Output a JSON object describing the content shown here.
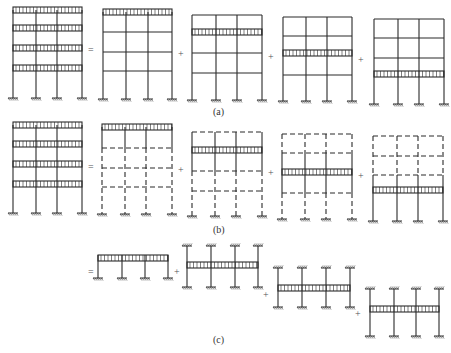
{
  "figure": {
    "colors": {
      "line": "#2a2a2a",
      "dashed": "#3a3a3a",
      "background": "#ffffff"
    },
    "labels": [
      {
        "text": "(a)",
        "x": 213,
        "y": 106
      },
      {
        "text": "(b)",
        "x": 213,
        "y": 224
      },
      {
        "text": "(c)",
        "x": 213,
        "y": 334
      }
    ],
    "operators": [
      {
        "text": "=",
        "x": 88,
        "y": 44
      },
      {
        "text": "+",
        "x": 178,
        "y": 48
      },
      {
        "text": "+",
        "x": 268,
        "y": 51
      },
      {
        "text": "+",
        "x": 358,
        "y": 54
      },
      {
        "text": "=",
        "x": 88,
        "y": 161
      },
      {
        "text": "+",
        "x": 178,
        "y": 164
      },
      {
        "text": "+",
        "x": 268,
        "y": 167
      },
      {
        "text": "+",
        "x": 358,
        "y": 170
      },
      {
        "text": "=",
        "x": 88,
        "y": 266
      },
      {
        "text": "+",
        "x": 174,
        "y": 266
      },
      {
        "text": "+",
        "x": 263,
        "y": 289
      },
      {
        "text": "+",
        "x": 355,
        "y": 308
      }
    ],
    "row_a": [
      {
        "name": "full-frame-all-loaded",
        "cols": [
          13,
          36,
          57,
          82
        ],
        "floors": [
          10,
          28,
          48,
          68
        ],
        "base": 98,
        "loaded": [
          0,
          1,
          2,
          3
        ],
        "dashed_floors": [],
        "solid_col_range": null
      },
      {
        "name": "top-floor-loaded",
        "cols": [
          103,
          126,
          148,
          172
        ],
        "floors": [
          12,
          32,
          52,
          71
        ],
        "base": 99,
        "loaded": [
          0
        ],
        "dashed_floors": [],
        "solid_col_range": null
      },
      {
        "name": "third-floor-loaded",
        "cols": [
          192,
          216,
          237,
          262
        ],
        "floors": [
          15,
          32,
          53,
          73
        ],
        "base": 100,
        "loaded": [
          1
        ],
        "dashed_floors": [],
        "solid_col_range": null
      },
      {
        "name": "second-floor-loaded",
        "cols": [
          283,
          306,
          327,
          352
        ],
        "floors": [
          17,
          36,
          53,
          75
        ],
        "base": 101,
        "loaded": [
          2
        ],
        "dashed_floors": [],
        "solid_col_range": null
      },
      {
        "name": "first-floor-loaded",
        "cols": [
          374,
          398,
          419,
          444
        ],
        "floors": [
          19,
          38,
          58,
          74
        ],
        "base": 104,
        "loaded": [
          3
        ],
        "dashed_floors": [],
        "solid_col_range": null
      }
    ],
    "row_b": [
      {
        "name": "full-frame-all-loaded",
        "cols": [
          13,
          36,
          57,
          82
        ],
        "floors": [
          125,
          144,
          164,
          184
        ],
        "base": 213,
        "loaded": [
          0,
          1,
          2,
          3
        ],
        "dashed_floors": [],
        "solid_col_range": null
      },
      {
        "name": "top-layer-open-frame",
        "cols": [
          102,
          125,
          146,
          172
        ],
        "floors": [
          127,
          148,
          168,
          187
        ],
        "base": 214,
        "loaded": [
          0
        ],
        "dashed_floors": [
          1,
          2,
          3
        ],
        "solid_col_range": [
          127,
          148
        ]
      },
      {
        "name": "third-layer-open-frame",
        "cols": [
          192,
          215,
          236,
          262
        ],
        "floors": [
          132,
          150,
          171,
          191
        ],
        "base": 216,
        "loaded": [
          1
        ],
        "dashed_floors": [
          0,
          2,
          3
        ],
        "solid_col_range": [
          132,
          171
        ]
      },
      {
        "name": "second-layer-open-frame",
        "cols": [
          282,
          305,
          326,
          352
        ],
        "floors": [
          134,
          153,
          172,
          193
        ],
        "base": 219,
        "loaded": [
          2
        ],
        "dashed_floors": [
          0,
          1,
          3
        ],
        "solid_col_range": [
          153,
          193
        ]
      },
      {
        "name": "first-layer-open-frame",
        "cols": [
          373,
          397,
          418,
          443
        ],
        "floors": [
          136,
          156,
          175,
          190
        ],
        "base": 221,
        "loaded": [
          3
        ],
        "dashed_floors": [
          0,
          1,
          2
        ],
        "solid_col_range": [
          175,
          221
        ]
      }
    ],
    "row_c": [
      {
        "name": "top-layer-subframe",
        "cols": [
          98,
          122,
          145,
          168
        ],
        "beam_y": 255,
        "top": null,
        "bottom": 278
      },
      {
        "name": "third-layer-subframe",
        "cols": [
          187,
          211,
          235,
          258
        ],
        "beam_y": 262,
        "top": 246,
        "bottom": 287
      },
      {
        "name": "second-layer-subframe",
        "cols": [
          278,
          302,
          326,
          350
        ],
        "beam_y": 285,
        "top": 268,
        "bottom": 307
      },
      {
        "name": "first-layer-subframe",
        "cols": [
          370,
          394,
          416,
          439
        ],
        "beam_y": 306,
        "top": 289,
        "bottom": 336
      }
    ]
  }
}
